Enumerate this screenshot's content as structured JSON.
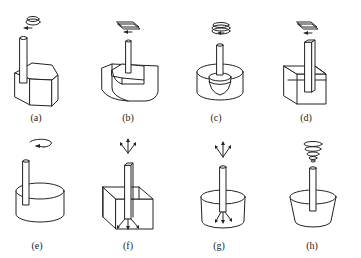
{
  "figures": [
    {
      "id": "a",
      "label": "(a)",
      "description": "rod in pentagonal prism block, rotating motion"
    },
    {
      "id": "b",
      "label": "(b)",
      "description": "rod in curved block with step, planar reciprocating motion"
    },
    {
      "id": "c",
      "label": "(c)",
      "description": "rod with hemispherical head in cylinder, spiral rotation"
    },
    {
      "id": "d",
      "label": "(d)",
      "description": "square rod in rectangular block, planar motion"
    },
    {
      "id": "e",
      "label": "(e)",
      "description": "rod in cylinder, rotation"
    },
    {
      "id": "f",
      "label": "(f)",
      "description": "rod in cube with diverging flow arrows"
    },
    {
      "id": "g",
      "label": "(g)",
      "description": "rod in cylinder with diverging flow arrows"
    },
    {
      "id": "h",
      "label": "(h)",
      "description": "rod in tapered cup with spiral motion"
    }
  ]
}
